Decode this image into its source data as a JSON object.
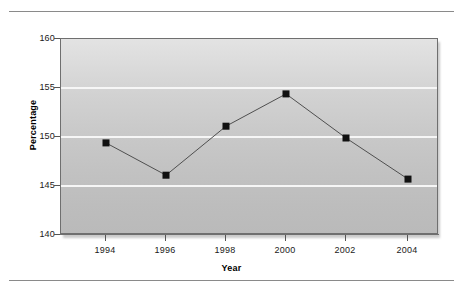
{
  "chart_data": {
    "type": "line",
    "title": "",
    "xlabel": "Year",
    "ylabel": "Percentage",
    "categories": [
      "1994",
      "1996",
      "1998",
      "2000",
      "2002",
      "2004"
    ],
    "x": [
      1994,
      1996,
      1998,
      2000,
      2002,
      2004
    ],
    "values": [
      149.4,
      146.1,
      151.1,
      154.4,
      149.9,
      145.7
    ],
    "series": [
      {
        "name": "Percentage",
        "values": [
          149.4,
          146.1,
          151.1,
          154.4,
          149.9,
          145.7
        ]
      }
    ],
    "ylim": [
      140,
      160
    ],
    "yticks": [
      140,
      145,
      150,
      155,
      160
    ],
    "ytick_labels": [
      "140",
      "145",
      "150",
      "155",
      "160"
    ],
    "xtick_labels": [
      "1994",
      "1996",
      "1998",
      "2000",
      "2002",
      "2004"
    ],
    "grid": true,
    "grid_axis": "y",
    "legend": false,
    "marker": "square",
    "marker_color": "#111111",
    "line_color": "#4f4f4f",
    "plot_background_top": "#e3e3e3",
    "plot_background_bottom": "#bababa",
    "gridline_color": "#f6f6f6",
    "annotations": []
  },
  "figure": {
    "top_rule": "",
    "bottom_rule": ""
  }
}
